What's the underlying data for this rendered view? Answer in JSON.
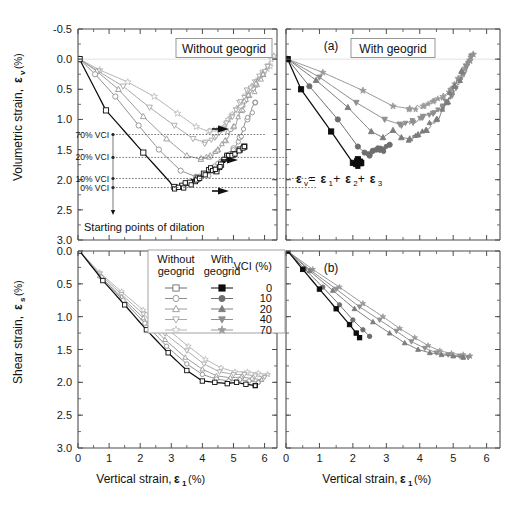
{
  "figure": {
    "width": 519,
    "height": 516,
    "background": "#ffffff"
  },
  "colors": {
    "axis": "#4d4d4d",
    "grid": "#d9d9d9",
    "black": "#0d0d0d",
    "gray_dark": "#6e6e6e",
    "gray_mid": "#8f8f8f",
    "gray_light": "#a8a8a8",
    "gray_lighter": "#bcbcbc",
    "text": "#111111"
  },
  "panels": [
    {
      "id": "top-left",
      "panel_label": "",
      "box_label": "Without geogrid",
      "xlabel": "",
      "ylabel": "Volumetric strain,  εv (%)"
    },
    {
      "id": "top-right",
      "panel_label": "(a)",
      "box_label": "With geogrid",
      "xlabel": "",
      "ylabel": ""
    },
    {
      "id": "bottom-left",
      "panel_label": "",
      "box_label": "",
      "xlabel": "Vertical strain,  ε1 (%)",
      "ylabel": "Shear strain,  εs (%)"
    },
    {
      "id": "bottom-right",
      "panel_label": "(b)",
      "box_label": "",
      "xlabel": "Vertical strain,  ε1 (%)",
      "ylabel": ""
    }
  ],
  "axis_titles": {
    "y_top": "Volumetric strain,",
    "y_top_sym": "ε",
    "y_top_sub": "v",
    "y_top_unit": "(%)",
    "y_bottom": "Shear strain,",
    "y_bottom_sym": "ε",
    "y_bottom_sub": "s",
    "y_bottom_unit": "(%)",
    "x": "Vertical strain,",
    "x_sym": "ε",
    "x_sub": "1",
    "x_unit": "(%)"
  },
  "annotations": {
    "equation": "εv = ε1 + ε2 + ε3",
    "equation_parts": [
      "ε",
      "v",
      " = ",
      "ε",
      "1",
      " + ",
      "ε",
      "2",
      " + ",
      "ε",
      "3"
    ],
    "dilation_caption": "Starting points of dilation",
    "vci_markers": [
      {
        "label": "70% VCI",
        "y": 1.25
      },
      {
        "label": "20% VCI",
        "y": 1.63
      },
      {
        "label": "10% VCI",
        "y": 1.98
      },
      {
        "label": "0% VCI",
        "y": 2.13
      }
    ]
  },
  "legend": {
    "header_without": "Without geogrid",
    "header_without_l1": "Without",
    "header_without_l2": "geogrid",
    "header_with": "With geogrid",
    "header_with_l1": "With",
    "header_with_l2": "geogrid",
    "header_vci": "VCI (%)",
    "entries": [
      {
        "vci": "0",
        "marker": "square",
        "open_color": "#ffffff",
        "fill_color": "#0d0d0d",
        "edge": "#6e6e6e"
      },
      {
        "vci": "10",
        "marker": "circle",
        "open_color": "#ffffff",
        "fill_color": "#6e6e6e",
        "edge": "#8f8f8f"
      },
      {
        "vci": "20",
        "marker": "triangle",
        "open_color": "#ffffff",
        "fill_color": "#7d7d7d",
        "edge": "#9a9a9a"
      },
      {
        "vci": "40",
        "marker": "dtriangle",
        "open_color": "#ffffff",
        "fill_color": "#8f8f8f",
        "edge": "#a8a8a8"
      },
      {
        "vci": "70",
        "marker": "star",
        "open_color": "#ffffff",
        "fill_color": "#9a9a9a",
        "edge": "#b5b5b5"
      }
    ]
  },
  "chart_data": {
    "type": "line",
    "xlabel": "Vertical strain, ε1 (%)",
    "xlim": [
      0,
      6.4
    ],
    "xticks": [
      0,
      1,
      2,
      3,
      4,
      5,
      6
    ],
    "subplots": [
      {
        "id": "top-left",
        "label": "Without geogrid",
        "ylabel": "Volumetric strain, εv (%)",
        "ylim": [
          -0.5,
          3.0
        ],
        "y_inverted": true,
        "yticks": [
          -0.5,
          0.0,
          0.5,
          1.0,
          1.5,
          2.0,
          2.5,
          3.0
        ],
        "series": [
          {
            "name": "0% VCI",
            "vci": 0,
            "marker": "square",
            "filled": false,
            "color": "#0d0d0d",
            "x": [
              0.05,
              0.9,
              2.1,
              3.1,
              3.35,
              3.6,
              3.85,
              4.05,
              4.25,
              4.45,
              4.6,
              4.8,
              5.0,
              5.2,
              5.35
            ],
            "y": [
              0.0,
              0.85,
              1.55,
              2.12,
              2.1,
              2.05,
              1.98,
              1.9,
              1.84,
              1.86,
              1.75,
              1.62,
              1.58,
              1.5,
              1.45
            ]
          },
          {
            "name": "10% VCI",
            "vci": 10,
            "marker": "circle",
            "filled": false,
            "color": "#8f8f8f",
            "x": [
              0.05,
              0.55,
              1.2,
              1.95,
              2.6,
              3.3,
              3.8,
              4.15,
              4.4,
              4.6,
              4.8,
              5.0,
              5.2,
              5.45,
              5.7
            ],
            "y": [
              0.0,
              0.25,
              0.62,
              1.1,
              1.5,
              1.85,
              1.95,
              1.9,
              1.78,
              1.7,
              1.6,
              1.48,
              1.3,
              1.0,
              0.72
            ]
          },
          {
            "name": "20% VCI",
            "vci": 20,
            "marker": "triangle",
            "filled": false,
            "color": "#9a9a9a",
            "x": [
              0.05,
              0.6,
              1.3,
              2.1,
              2.85,
              3.5,
              3.95,
              4.25,
              4.5,
              4.75,
              5.0,
              5.25,
              5.5,
              5.75,
              5.95
            ],
            "y": [
              0.0,
              0.2,
              0.5,
              0.95,
              1.32,
              1.6,
              1.66,
              1.6,
              1.5,
              1.35,
              1.12,
              0.85,
              0.6,
              0.42,
              0.25
            ]
          },
          {
            "name": "40% VCI",
            "vci": 40,
            "marker": "dtriangle",
            "filled": false,
            "color": "#a8a8a8",
            "x": [
              0.05,
              0.65,
              1.45,
              2.3,
              3.1,
              3.7,
              4.1,
              4.4,
              4.7,
              4.95,
              5.2,
              5.45,
              5.7,
              5.95,
              6.1
            ],
            "y": [
              0.0,
              0.2,
              0.45,
              0.8,
              1.1,
              1.32,
              1.38,
              1.3,
              1.15,
              0.95,
              0.72,
              0.52,
              0.38,
              0.22,
              0.12
            ]
          },
          {
            "name": "70% VCI",
            "vci": 70,
            "marker": "star",
            "filled": false,
            "color": "#b5b5b5",
            "x": [
              0.05,
              0.7,
              1.6,
              2.45,
              3.2,
              3.8,
              4.2,
              4.55,
              4.85,
              5.1,
              5.4,
              5.7,
              5.95,
              6.15,
              6.3
            ],
            "y": [
              0.0,
              0.18,
              0.38,
              0.62,
              0.9,
              1.12,
              1.2,
              1.15,
              1.0,
              0.82,
              0.6,
              0.42,
              0.25,
              0.1,
              -0.05
            ]
          }
        ]
      },
      {
        "id": "top-right",
        "label": "With geogrid",
        "panel_label": "(a)",
        "ylabel": "Volumetric strain, εv (%)",
        "ylim": [
          -0.5,
          3.0
        ],
        "y_inverted": true,
        "yticks": [
          -0.5,
          0.0,
          0.5,
          1.0,
          1.5,
          2.0,
          2.5,
          3.0
        ],
        "series": [
          {
            "name": "0% VCI",
            "vci": 0,
            "marker": "square",
            "filled": true,
            "color": "#0d0d0d",
            "x": [
              0.05,
              0.45,
              1.35,
              2.0,
              2.1,
              2.2,
              2.15,
              2.25
            ],
            "y": [
              0.0,
              0.5,
              1.2,
              1.72,
              1.74,
              1.7,
              1.66,
              1.72
            ]
          },
          {
            "name": "10% VCI",
            "vci": 10,
            "marker": "circle",
            "filled": true,
            "color": "#6e6e6e",
            "x": [
              0.05,
              0.7,
              1.55,
              2.15,
              2.35,
              2.5,
              2.6,
              2.75,
              2.9,
              3.1
            ],
            "y": [
              0.0,
              0.45,
              1.0,
              1.45,
              1.55,
              1.6,
              1.52,
              1.48,
              1.5,
              1.42
            ]
          },
          {
            "name": "20% VCI",
            "vci": 20,
            "marker": "triangle",
            "filled": true,
            "color": "#7d7d7d",
            "x": [
              0.05,
              0.9,
              1.85,
              2.55,
              2.9,
              3.2,
              3.45,
              3.7,
              3.95,
              4.2,
              4.5,
              4.8,
              5.05,
              5.25
            ],
            "y": [
              0.0,
              0.35,
              0.8,
              1.2,
              1.3,
              1.18,
              1.3,
              1.32,
              1.25,
              1.18,
              1.0,
              0.72,
              0.45,
              0.2
            ]
          },
          {
            "name": "40% VCI",
            "vci": 40,
            "marker": "dtriangle",
            "filled": true,
            "color": "#8f8f8f",
            "x": [
              0.05,
              1.0,
              2.1,
              2.95,
              3.4,
              3.8,
              4.1,
              4.4,
              4.7,
              4.95,
              5.2,
              5.4,
              5.55
            ],
            "y": [
              0.0,
              0.3,
              0.72,
              1.0,
              1.08,
              1.05,
              0.95,
              0.9,
              0.78,
              0.6,
              0.35,
              0.12,
              -0.05
            ]
          },
          {
            "name": "70% VCI",
            "vci": 70,
            "marker": "star",
            "filled": true,
            "color": "#9a9a9a",
            "x": [
              0.05,
              1.1,
              2.3,
              3.2,
              3.7,
              4.1,
              4.4,
              4.7,
              4.95,
              5.15,
              5.35,
              5.5,
              5.6
            ],
            "y": [
              0.0,
              0.22,
              0.52,
              0.78,
              0.82,
              0.78,
              0.7,
              0.62,
              0.5,
              0.32,
              0.15,
              0.02,
              -0.08
            ]
          }
        ]
      },
      {
        "id": "bottom-left",
        "label": "Without geogrid",
        "ylabel": "Shear strain, εs (%)",
        "ylim": [
          0.0,
          3.0
        ],
        "y_inverted": true,
        "yticks": [
          0.0,
          0.5,
          1.0,
          1.5,
          2.0,
          2.5,
          3.0
        ],
        "series": [
          {
            "name": "0% VCI",
            "vci": 0,
            "marker": "square",
            "filled": false,
            "color": "#0d0d0d",
            "x": [
              0.05,
              0.8,
              1.5,
              2.2,
              2.9,
              3.5,
              4.0,
              4.4,
              4.8,
              5.1,
              5.4,
              5.7
            ],
            "y": [
              0.0,
              0.45,
              0.82,
              1.2,
              1.55,
              1.82,
              1.98,
              2.0,
              2.02,
              2.0,
              2.03,
              2.05
            ]
          },
          {
            "name": "10% VCI",
            "vci": 10,
            "marker": "circle",
            "filled": false,
            "color": "#8f8f8f",
            "x": [
              0.05,
              0.75,
              1.45,
              2.15,
              2.85,
              3.5,
              4.0,
              4.45,
              4.85,
              5.2,
              5.5,
              5.8
            ],
            "y": [
              0.0,
              0.4,
              0.75,
              1.1,
              1.45,
              1.72,
              1.88,
              1.95,
              1.98,
              1.96,
              1.98,
              2.0
            ]
          },
          {
            "name": "20% VCI",
            "vci": 20,
            "marker": "triangle",
            "filled": false,
            "color": "#9a9a9a",
            "x": [
              0.05,
              0.7,
              1.4,
              2.1,
              2.8,
              3.45,
              4.0,
              4.45,
              4.9,
              5.25,
              5.6,
              5.9
            ],
            "y": [
              0.0,
              0.38,
              0.7,
              1.02,
              1.35,
              1.62,
              1.8,
              1.9,
              1.93,
              1.92,
              1.94,
              1.96
            ]
          },
          {
            "name": "40% VCI",
            "vci": 40,
            "marker": "dtriangle",
            "filled": false,
            "color": "#a8a8a8",
            "x": [
              0.05,
              0.7,
              1.4,
              2.1,
              2.8,
              3.5,
              4.05,
              4.55,
              5.0,
              5.35,
              5.7,
              6.0
            ],
            "y": [
              0.0,
              0.35,
              0.66,
              0.96,
              1.26,
              1.52,
              1.72,
              1.84,
              1.88,
              1.88,
              1.9,
              1.92
            ]
          },
          {
            "name": "70% VCI",
            "vci": 70,
            "marker": "star",
            "filled": false,
            "color": "#b5b5b5",
            "x": [
              0.05,
              0.7,
              1.4,
              2.1,
              2.85,
              3.55,
              4.1,
              4.6,
              5.05,
              5.45,
              5.8,
              6.1
            ],
            "y": [
              0.0,
              0.33,
              0.62,
              0.9,
              1.18,
              1.45,
              1.65,
              1.78,
              1.84,
              1.84,
              1.86,
              1.88
            ]
          }
        ]
      },
      {
        "id": "bottom-right",
        "label": "With geogrid",
        "panel_label": "(b)",
        "ylabel": "Shear strain, εs (%)",
        "ylim": [
          0.0,
          3.0
        ],
        "y_inverted": true,
        "yticks": [
          0.0,
          0.5,
          1.0,
          1.5,
          2.0,
          2.5,
          3.0
        ],
        "series": [
          {
            "name": "0% VCI",
            "vci": 0,
            "marker": "square",
            "filled": true,
            "color": "#0d0d0d",
            "x": [
              0.05,
              0.5,
              1.0,
              1.5,
              1.9,
              2.1,
              2.2
            ],
            "y": [
              0.0,
              0.28,
              0.58,
              0.88,
              1.12,
              1.25,
              1.32
            ]
          },
          {
            "name": "10% VCI",
            "vci": 10,
            "marker": "circle",
            "filled": true,
            "color": "#6e6e6e",
            "x": [
              0.05,
              0.55,
              1.1,
              1.6,
              2.0,
              2.3,
              2.5
            ],
            "y": [
              0.0,
              0.27,
              0.55,
              0.82,
              1.05,
              1.2,
              1.3
            ]
          },
          {
            "name": "20% VCI",
            "vci": 20,
            "marker": "triangle",
            "filled": true,
            "color": "#7d7d7d",
            "x": [
              0.05,
              0.7,
              1.4,
              2.05,
              2.6,
              3.1,
              3.55,
              3.95,
              4.3,
              4.65,
              5.0,
              5.3
            ],
            "y": [
              0.0,
              0.3,
              0.6,
              0.88,
              1.08,
              1.25,
              1.4,
              1.5,
              1.55,
              1.58,
              1.6,
              1.62
            ]
          },
          {
            "name": "40% VCI",
            "vci": 40,
            "marker": "dtriangle",
            "filled": true,
            "color": "#8f8f8f",
            "x": [
              0.05,
              0.75,
              1.5,
              2.2,
              2.8,
              3.3,
              3.75,
              4.15,
              4.5,
              4.85,
              5.2,
              5.45
            ],
            "y": [
              0.0,
              0.3,
              0.58,
              0.85,
              1.05,
              1.22,
              1.38,
              1.48,
              1.55,
              1.58,
              1.6,
              1.62
            ]
          },
          {
            "name": "70% VCI",
            "vci": 70,
            "marker": "star",
            "filled": true,
            "color": "#9a9a9a",
            "x": [
              0.05,
              0.8,
              1.6,
              2.3,
              2.9,
              3.4,
              3.85,
              4.25,
              4.6,
              4.95,
              5.3,
              5.5
            ],
            "y": [
              0.0,
              0.28,
              0.55,
              0.8,
              1.0,
              1.18,
              1.32,
              1.44,
              1.52,
              1.56,
              1.58,
              1.6
            ]
          }
        ]
      }
    ]
  }
}
